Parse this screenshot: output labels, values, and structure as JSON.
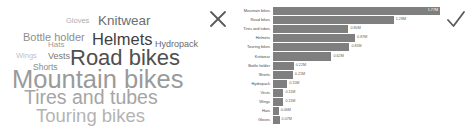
{
  "wordcloud": {
    "name": "product-category-word-cloud",
    "words": [
      {
        "text": "Mountain bikes",
        "size": 25.5,
        "color": "#9a9a9a",
        "left": 12,
        "top": 67
      },
      {
        "text": "Road bikes",
        "size": 22.0,
        "color": "#4f4f4f",
        "left": 70,
        "top": 47
      },
      {
        "text": "Tires and tubes",
        "size": 19.5,
        "color": "#a5a5a5",
        "left": 24,
        "top": 88
      },
      {
        "text": "Touring bikes",
        "size": 18.5,
        "color": "#b4b4b4",
        "left": 36,
        "top": 107
      },
      {
        "text": "Helmets",
        "size": 16.5,
        "color": "#3f3f3f",
        "left": 92,
        "top": 31
      },
      {
        "text": "Knitwear",
        "size": 13.5,
        "color": "#6e6e6e",
        "left": 98,
        "top": 14
      },
      {
        "text": "Bottle holder",
        "size": 11.0,
        "color": "#8e8e8e",
        "left": 23,
        "top": 32
      },
      {
        "text": "Hydropack",
        "size": 9.0,
        "color": "#6a6a6a",
        "left": 155,
        "top": 40
      },
      {
        "text": "Vests",
        "size": 9.0,
        "color": "#787878",
        "left": 48,
        "top": 52
      },
      {
        "text": "Shorts",
        "size": 8.5,
        "color": "#8a8a8a",
        "left": 33,
        "top": 63
      },
      {
        "text": "Hats",
        "size": 8.0,
        "color": "#9b9b9b",
        "left": 48,
        "top": 41
      },
      {
        "text": "Gloves",
        "size": 7.5,
        "color": "#aeaeae",
        "left": 66,
        "top": 17
      },
      {
        "text": "Wings",
        "size": 7.5,
        "color": "#c2c2c2",
        "left": 16,
        "top": 52
      }
    ]
  },
  "icons": {
    "reject": "x-mark-icon",
    "accept": "check-mark-icon"
  },
  "chart_data": {
    "type": "bar",
    "orientation": "horizontal",
    "title": "",
    "xlabel": "",
    "ylabel": "",
    "grid": false,
    "legend": null,
    "xlim": [
      0,
      1.77
    ],
    "unit": "M",
    "bar_color": "#7f7f7f",
    "categories": [
      "Mountain bikes",
      "Road bikes",
      "Tires and tubes",
      "Helmets",
      "Touring bikes",
      "Knitwear",
      "Bottle holder",
      "Shorts",
      "Hydropack",
      "Vests",
      "Wings",
      "Hats",
      "Gloves"
    ],
    "values": [
      1.77,
      1.28,
      0.8,
      0.87,
      0.81,
      0.62,
      0.22,
      0.21,
      0.15,
      0.11,
      0.11,
      0.06,
      0.07
    ],
    "labels": [
      "1.77M",
      "1.28M",
      "0.80M",
      "0.87M",
      "0.81M",
      "0.62M",
      "0.22M",
      "0.21M",
      "0.15M",
      "0.11M",
      "0.11M",
      "0.06M",
      "0.07M"
    ],
    "label_inside": [
      true,
      false,
      false,
      false,
      false,
      false,
      false,
      false,
      false,
      false,
      false,
      false,
      false
    ]
  }
}
